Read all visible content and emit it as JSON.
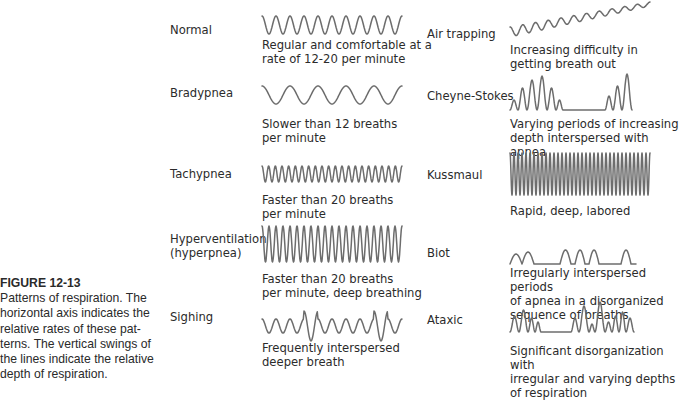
{
  "caption": {
    "figure_number": "FIGURE 12-13",
    "text": "Patterns of respiration. The horizontal axis indicates the relative rates of these pat-terns. The vertical swings of the lines indicate the relative depth of respiration."
  },
  "colors": {
    "wave_stroke": "#6d6d6d",
    "text": "#2b2b2b"
  },
  "patterns": [
    {
      "name": "Normal",
      "description": "Regular and comfortable at a\nrate of 12-20 per minute"
    },
    {
      "name": "Bradypnea",
      "description": "Slower than 12 breaths\nper minute"
    },
    {
      "name": "Tachypnea",
      "description": "Faster than 20 breaths\nper minute"
    },
    {
      "name": "Hyperventilation\n(hyperpnea)",
      "description": "Faster than 20 breaths\nper minute, deep breathing"
    },
    {
      "name": "Sighing",
      "description": "Frequently interspersed\ndeeper breath"
    },
    {
      "name": "Air trapping",
      "description": "Increasing difficulty in\ngetting breath out"
    },
    {
      "name": "Cheyne-Stokes",
      "description": "Varying periods of increasing\ndepth interspersed with apnea"
    },
    {
      "name": "Kussmaul",
      "description": "Rapid, deep, labored"
    },
    {
      "name": "Biot",
      "description": "Irregularly interspersed periods\nof apnea in a disorganized\nsequence of breaths"
    },
    {
      "name": "Ataxic",
      "description": "Significant disorganization with\nirregular and varying depths\nof respiration"
    }
  ],
  "waves": {
    "normal": {
      "cycles": 10,
      "amplitude": 9
    },
    "bradypnea": {
      "cycles": 5,
      "amplitude": 9
    },
    "tachypnea": {
      "cycles": 21,
      "amplitude": 8
    },
    "hyperventilation": {
      "cycles": 20,
      "amplitude": 18
    },
    "kussmaul": {
      "cycles": 35,
      "amplitude": 21
    }
  }
}
